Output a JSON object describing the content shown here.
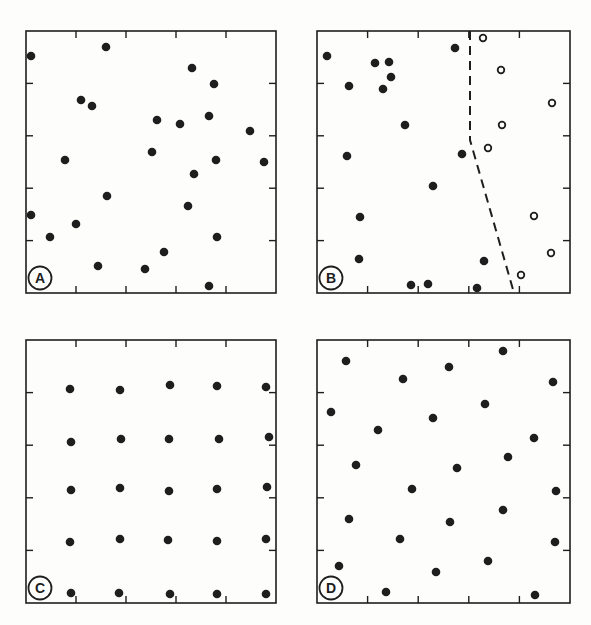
{
  "figure": {
    "panels": [
      {
        "id": "A",
        "label": "A",
        "pattern": "random",
        "box": {
          "x": 26,
          "y": 31,
          "w": 250,
          "h": 262
        },
        "ticks": {
          "top": [
            0.2,
            0.4,
            0.6,
            0.8
          ],
          "bottom": [
            0.2,
            0.4,
            0.6,
            0.8
          ],
          "right": [
            0.2,
            0.4,
            0.6,
            0.8
          ],
          "left": [
            0.2,
            0.4,
            0.6,
            0.8
          ]
        },
        "filled_points": [
          [
            5,
            25
          ],
          [
            80,
            16
          ],
          [
            166,
            37
          ],
          [
            188,
            53
          ],
          [
            55,
            69
          ],
          [
            66,
            75
          ],
          [
            131,
            89
          ],
          [
            154,
            93
          ],
          [
            183,
            85
          ],
          [
            224,
            100
          ],
          [
            39,
            129
          ],
          [
            126,
            121
          ],
          [
            190,
            129
          ],
          [
            238,
            131
          ],
          [
            168,
            143
          ],
          [
            81,
            165
          ],
          [
            162,
            175
          ],
          [
            5,
            184
          ],
          [
            50,
            193
          ],
          [
            24,
            206
          ],
          [
            191,
            206
          ],
          [
            138,
            221
          ],
          [
            72,
            235
          ],
          [
            119,
            238
          ],
          [
            183,
            255
          ]
        ],
        "open_points": [],
        "dashed_line": []
      },
      {
        "id": "B",
        "label": "B",
        "pattern": "segregated (two classes separated by boundary)",
        "box": {
          "x": 317,
          "y": 31,
          "w": 253,
          "h": 262
        },
        "ticks": {
          "top": [
            0.2,
            0.4,
            0.6,
            0.8
          ],
          "bottom": [
            0.2,
            0.4,
            0.6,
            0.8
          ],
          "right": [
            0.2,
            0.4,
            0.6,
            0.8
          ],
          "left": [
            0.2,
            0.4,
            0.6,
            0.8
          ]
        },
        "filled_points": [
          [
            10,
            25
          ],
          [
            58,
            32
          ],
          [
            72,
            31
          ],
          [
            74,
            46
          ],
          [
            66,
            58
          ],
          [
            32,
            55
          ],
          [
            88,
            94
          ],
          [
            30,
            125
          ],
          [
            145,
            123
          ],
          [
            116,
            155
          ],
          [
            43,
            186
          ],
          [
            42,
            228
          ],
          [
            167,
            230
          ],
          [
            94,
            254
          ],
          [
            111,
            253
          ],
          [
            160,
            257
          ],
          [
            138,
            17
          ]
        ],
        "open_points": [
          [
            166,
            7
          ],
          [
            184,
            39
          ],
          [
            235,
            72
          ],
          [
            185,
            94
          ],
          [
            171,
            117
          ],
          [
            217,
            185
          ],
          [
            234,
            222
          ],
          [
            204,
            244
          ]
        ],
        "dashed_line": [
          [
            153,
            0
          ],
          [
            153,
            109
          ],
          [
            197,
            262
          ]
        ]
      },
      {
        "id": "C",
        "label": "C",
        "pattern": "regular grid",
        "box": {
          "x": 26,
          "y": 340,
          "w": 250,
          "h": 263
        },
        "ticks": {
          "top": [
            0.2,
            0.4,
            0.6,
            0.8
          ],
          "bottom": [
            0.2,
            0.4,
            0.6,
            0.8
          ],
          "right": [
            0.2,
            0.4,
            0.6,
            0.8
          ],
          "left": [
            0.2,
            0.4,
            0.6,
            0.8
          ]
        },
        "filled_points": [
          [
            44,
            49
          ],
          [
            94,
            50
          ],
          [
            144,
            45
          ],
          [
            191,
            46
          ],
          [
            240,
            47
          ],
          [
            45,
            102
          ],
          [
            95,
            99
          ],
          [
            143,
            99
          ],
          [
            193,
            99
          ],
          [
            243,
            97
          ],
          [
            45,
            150
          ],
          [
            94,
            148
          ],
          [
            143,
            151
          ],
          [
            191,
            149
          ],
          [
            241,
            147
          ],
          [
            44,
            202
          ],
          [
            94,
            199
          ],
          [
            142,
            200
          ],
          [
            191,
            201
          ],
          [
            240,
            199
          ],
          [
            45,
            253
          ],
          [
            93,
            253
          ],
          [
            144,
            254
          ],
          [
            191,
            254
          ],
          [
            240,
            254
          ]
        ],
        "open_points": [],
        "dashed_line": []
      },
      {
        "id": "D",
        "label": "D",
        "pattern": "dispersed (uniform, non-grid)",
        "box": {
          "x": 317,
          "y": 340,
          "w": 253,
          "h": 263
        },
        "ticks": {
          "top": [
            0.2,
            0.4,
            0.6,
            0.8
          ],
          "bottom": [
            0.2,
            0.4,
            0.6,
            0.8
          ],
          "right": [
            0.2,
            0.4,
            0.6,
            0.8
          ],
          "left": [
            0.2,
            0.4,
            0.6,
            0.8
          ]
        },
        "filled_points": [
          [
            29,
            21
          ],
          [
            186,
            11
          ],
          [
            132,
            27
          ],
          [
            86,
            39
          ],
          [
            236,
            42
          ],
          [
            14,
            72
          ],
          [
            168,
            64
          ],
          [
            116,
            78
          ],
          [
            61,
            90
          ],
          [
            217,
            98
          ],
          [
            39,
            125
          ],
          [
            191,
            117
          ],
          [
            140,
            128
          ],
          [
            95,
            149
          ],
          [
            239,
            151
          ],
          [
            32,
            179
          ],
          [
            186,
            170
          ],
          [
            133,
            182
          ],
          [
            83,
            199
          ],
          [
            238,
            202
          ],
          [
            22,
            226
          ],
          [
            171,
            221
          ],
          [
            119,
            232
          ],
          [
            69,
            252
          ],
          [
            218,
            255
          ]
        ],
        "open_points": [],
        "dashed_line": []
      }
    ]
  }
}
